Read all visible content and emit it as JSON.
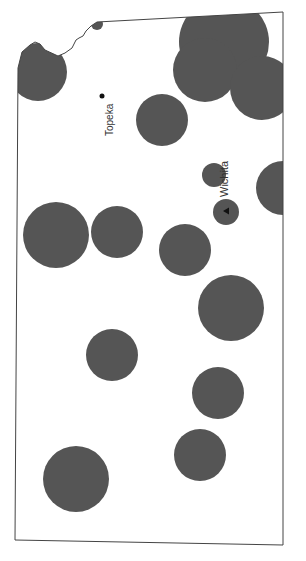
{
  "map": {
    "title": "",
    "region": "Kansas (rotated)",
    "colors": {
      "background": "#ffffff",
      "border": "#444444",
      "circle_fill": "#555555",
      "marker": "#111111"
    },
    "cities": [
      {
        "name": "Topeka",
        "marker": "dot",
        "x": 102,
        "y": 96,
        "label_x": 112,
        "label_y": 122,
        "rotate": -90
      },
      {
        "name": "Wichita",
        "marker": "triangle",
        "x": 226,
        "y": 211,
        "label_x": 226,
        "label_y": 180,
        "rotate": -90
      }
    ],
    "circles": [
      {
        "cx": 38,
        "cy": 72,
        "r": 29
      },
      {
        "cx": 97,
        "cy": 24,
        "r": 6
      },
      {
        "cx": 224,
        "cy": 42,
        "r": 45
      },
      {
        "cx": 205,
        "cy": 70,
        "r": 32
      },
      {
        "cx": 262,
        "cy": 88,
        "r": 32
      },
      {
        "cx": 162,
        "cy": 120,
        "r": 26
      },
      {
        "cx": 283,
        "cy": 188,
        "r": 27
      },
      {
        "cx": 214,
        "cy": 175,
        "r": 12
      },
      {
        "cx": 226,
        "cy": 212,
        "r": 13
      },
      {
        "cx": 56,
        "cy": 235,
        "r": 33
      },
      {
        "cx": 117,
        "cy": 232,
        "r": 26
      },
      {
        "cx": 185,
        "cy": 250,
        "r": 26
      },
      {
        "cx": 231,
        "cy": 308,
        "r": 33
      },
      {
        "cx": 112,
        "cy": 355,
        "r": 26
      },
      {
        "cx": 218,
        "cy": 393,
        "r": 26
      },
      {
        "cx": 200,
        "cy": 455,
        "r": 26
      },
      {
        "cx": 76,
        "cy": 479,
        "r": 33
      }
    ]
  }
}
